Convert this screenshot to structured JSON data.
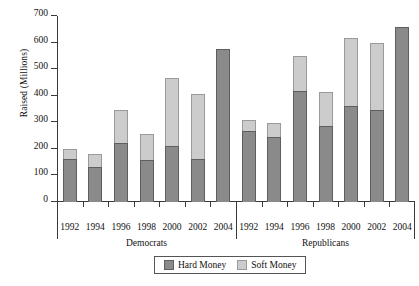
{
  "chart_data": {
    "type": "bar",
    "subtype": "stacked",
    "title": "",
    "xlabel": "",
    "ylabel": "Raised (Millions)",
    "ylim": [
      0,
      700
    ],
    "yticks": [
      0,
      100,
      200,
      300,
      400,
      500,
      600,
      700
    ],
    "grid": false,
    "legend_position": "bottom-center",
    "categories": [
      "1992",
      "1994",
      "1996",
      "1998",
      "2000",
      "2002",
      "2004"
    ],
    "groups": [
      {
        "name": "Democrats",
        "categories": [
          "1992",
          "1994",
          "1996",
          "1998",
          "2000",
          "2002",
          "2004"
        ],
        "series": [
          {
            "name": "Hard Money",
            "values": [
              163,
              132,
              222,
              157,
              212,
              162,
              576
            ]
          },
          {
            "name": "Soft Money",
            "values": [
              37,
              50,
              123,
              98,
              256,
              245,
              0
            ]
          }
        ],
        "totals": [
          200,
          182,
          345,
          255,
          468,
          407,
          576
        ]
      },
      {
        "name": "Republicans",
        "categories": [
          "1992",
          "1994",
          "1996",
          "1998",
          "2000",
          "2002",
          "2004"
        ],
        "series": [
          {
            "name": "Hard Money",
            "values": [
              266,
              246,
              416,
              285,
              361,
              346,
              657
            ]
          },
          {
            "name": "Soft Money",
            "values": [
              44,
              50,
              133,
              129,
              256,
              251,
              0
            ]
          }
        ],
        "totals": [
          310,
          296,
          549,
          414,
          617,
          597,
          657
        ]
      }
    ],
    "legend": [
      {
        "label": "Hard Money",
        "color": "#8a8a8a"
      },
      {
        "label": "Soft Money",
        "color": "#cccccc"
      }
    ]
  },
  "colors": {
    "hard_money": "#8a8a8a",
    "soft_money": "#cccccc",
    "axis": "#3a3a3a",
    "background": "#ffffff"
  }
}
